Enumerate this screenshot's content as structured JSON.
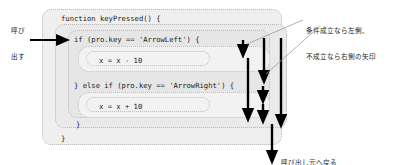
{
  "diagram": {
    "title_code": "function keyPressed() {",
    "boxes": [
      {
        "id": "function-box",
        "label": "function keyPressed() {"
      },
      {
        "id": "function-body-box",
        "label": ""
      },
      {
        "id": "if-branch-box",
        "label": "if (pro.key == 'ArrowLeft') {"
      },
      {
        "id": "if-body-box",
        "label": ""
      },
      {
        "id": "else-if-branch-box",
        "label": "} else if (pro.key == 'ArrowRight') {"
      },
      {
        "id": "else-if-body-box",
        "label": ""
      }
    ],
    "code_lines": {
      "function_header": "function keyPressed() {",
      "if_header": "if (pro.key == 'ArrowLeft') {",
      "if_statement": "x = x - 10",
      "else_if_header": "} else if (pro.key == 'ArrowRight') {",
      "else_if_statement": "x = x + 10",
      "inner_close_brace": "}",
      "outer_close_brace": "}"
    },
    "annotations": [
      {
        "id": "call-label",
        "lines": [
          "呼び",
          "出す"
        ],
        "text": "呼び出す"
      },
      {
        "id": "condition-label",
        "lines": [
          "条件成立なら左側、",
          "不成立なら右側の矢印"
        ],
        "text": "条件成立なら左側、不成立なら右側の矢印"
      },
      {
        "id": "return-label",
        "lines": [
          "呼び出し元へ戻る"
        ],
        "text": "呼び出し元へ戻る"
      }
    ],
    "arrows": [
      {
        "id": "entry-arrow",
        "direction": "right"
      },
      {
        "id": "if-true-arrow",
        "direction": "down"
      },
      {
        "id": "if-false-arrow",
        "direction": "down"
      },
      {
        "id": "elseif-true-arrow",
        "direction": "down"
      },
      {
        "id": "elseif-false-arrow",
        "direction": "down"
      },
      {
        "id": "merge-arrow",
        "direction": "down"
      },
      {
        "id": "return-arrow",
        "direction": "down"
      }
    ],
    "colors": {
      "arrow": "#000000",
      "box_border": "#b9b9b9",
      "box_fill": "#ececec",
      "statement_fill": "#f2f2f2",
      "text": "#1a1a1a",
      "leader_line": "#9a9a9a"
    }
  }
}
